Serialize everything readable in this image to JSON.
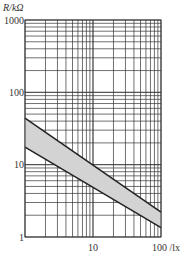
{
  "chart_data": {
    "type": "area",
    "title": "",
    "xlabel": "lx",
    "ylabel": "R/kΩ",
    "x_label_text": "100 /lx",
    "y_label_text": "R/kΩ",
    "x_scale": "log",
    "y_scale": "log",
    "xlim": [
      1,
      100
    ],
    "ylim": [
      1,
      1000
    ],
    "x_ticks": [
      "10",
      "100"
    ],
    "y_ticks": [
      "1",
      "10",
      "100",
      "1000"
    ],
    "grid": true,
    "legend": null,
    "series": [
      {
        "name": "upper bound",
        "x": [
          1,
          100
        ],
        "y": [
          44,
          2.2
        ]
      },
      {
        "name": "lower bound",
        "x": [
          1,
          100
        ],
        "y": [
          17.5,
          1.35
        ]
      }
    ],
    "band_fill": "#d3d3d3",
    "line_color": "#222222",
    "grid_color": "#333333"
  }
}
